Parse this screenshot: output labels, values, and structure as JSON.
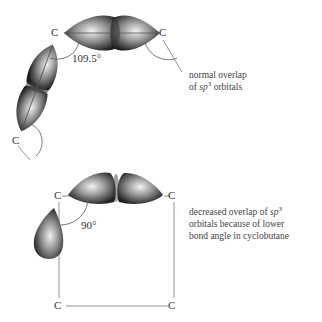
{
  "diagram": {
    "panels": [
      {
        "id": "normal",
        "atoms": [
          "C",
          "C",
          "C"
        ],
        "angle_label": "109.5°",
        "caption": {
          "line1": "normal overlap",
          "line2_prefix": "of ",
          "line2_italic": "sp",
          "line2_sup": "3",
          "line2_suffix": " orbitals"
        }
      },
      {
        "id": "cyclobutane",
        "atoms": [
          "C",
          "C",
          "C",
          "C"
        ],
        "angle_label": "90°",
        "caption": {
          "line1_prefix": "decreased overlap of ",
          "line1_italic": "sp",
          "line1_sup": "3",
          "line2": "orbitals because of lower",
          "line3": "bond angle in cyclobutane"
        }
      }
    ],
    "colors": {
      "orbital_dark": "#2a2a2a",
      "orbital_light": "#e8e8e8",
      "line": "#888888",
      "text": "#333333"
    }
  }
}
